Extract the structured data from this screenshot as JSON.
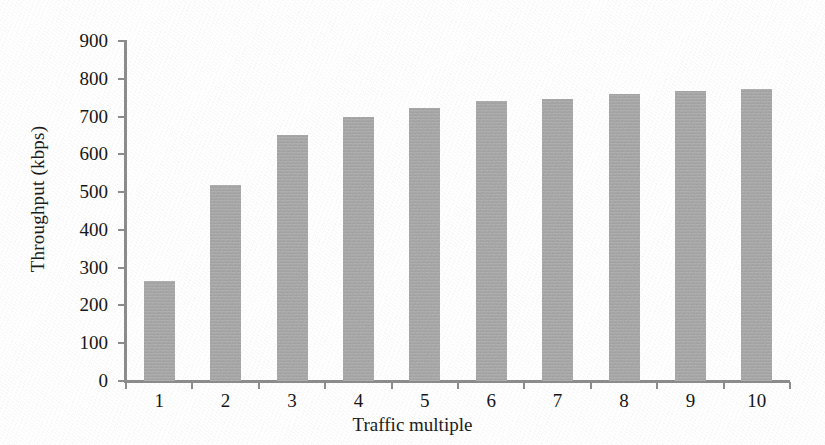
{
  "chart_data": {
    "type": "bar",
    "title": "",
    "subtitle": "",
    "xlabel": "Traffic multiple",
    "ylabel": "Throughput (kbps)",
    "categories": [
      "1",
      "2",
      "3",
      "4",
      "5",
      "6",
      "7",
      "8",
      "9",
      "10"
    ],
    "values": [
      265,
      520,
      650,
      700,
      723,
      742,
      747,
      760,
      767,
      772
    ],
    "series": [
      {
        "name": "Throughput",
        "values": [
          265,
          520,
          650,
          700,
          723,
          742,
          747,
          760,
          767,
          772
        ]
      }
    ],
    "ylim": [
      0,
      900
    ],
    "ytick_labels": [
      "0",
      "100",
      "200",
      "300",
      "400",
      "500",
      "600",
      "700",
      "800",
      "900"
    ],
    "ytick_values": [
      0,
      100,
      200,
      300,
      400,
      500,
      600,
      700,
      800,
      900
    ],
    "xtick_labels": [
      "1",
      "2",
      "3",
      "4",
      "5",
      "6",
      "7",
      "8",
      "9",
      "10"
    ],
    "grid": false,
    "legend": false,
    "legend_position": "none",
    "bar_color": "#a9a9a9",
    "axis_color": "#8d8d8d",
    "text_color": "#161616",
    "background_color": "#ffffff",
    "annotations": []
  }
}
